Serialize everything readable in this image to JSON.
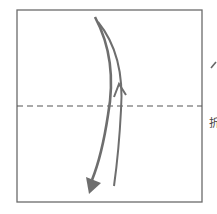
{
  "diagram": {
    "type": "origami-fold-step",
    "paper": {
      "x": 17,
      "y": 10,
      "width": 185,
      "height": 192,
      "border_color": "#6b6b6b"
    },
    "fold_line": {
      "y": 106,
      "style": "dashed",
      "color": "#555555"
    },
    "arrows": [
      {
        "name": "fold-down-arrow",
        "direction": "down",
        "color": "#6e6e6e"
      },
      {
        "name": "unfold-up-arrow",
        "direction": "up",
        "color": "#6e6e6e"
      }
    ],
    "side_label": "折",
    "colors": {
      "stroke": "#6e6e6e",
      "background": "#ffffff"
    }
  }
}
